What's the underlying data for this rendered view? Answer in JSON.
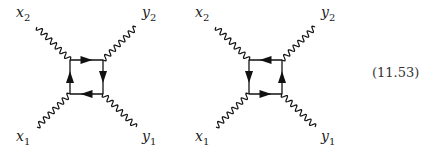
{
  "equation_number": "(11.53)",
  "diagrams": [
    {
      "name": "box-diagram-1",
      "offset": 0,
      "labels": {
        "x2": "x",
        "x2_sub": "2",
        "y2": "y",
        "y2_sub": "2",
        "x1": "x",
        "x1_sub": "1",
        "y1": "y",
        "y1_sub": "1"
      },
      "arrows": {
        "top": "right",
        "right": "down",
        "bottom": "left",
        "left": "up"
      }
    },
    {
      "name": "box-diagram-2",
      "offset": 179,
      "labels": {
        "x2": "x",
        "x2_sub": "2",
        "y2": "y",
        "y2_sub": "2",
        "x1": "x",
        "x1_sub": "1",
        "y1": "y",
        "y1_sub": "1"
      },
      "arrows": {
        "top": "left",
        "right": "up",
        "bottom": "right",
        "left": "down"
      }
    }
  ],
  "colors": {
    "line": "#111111"
  }
}
